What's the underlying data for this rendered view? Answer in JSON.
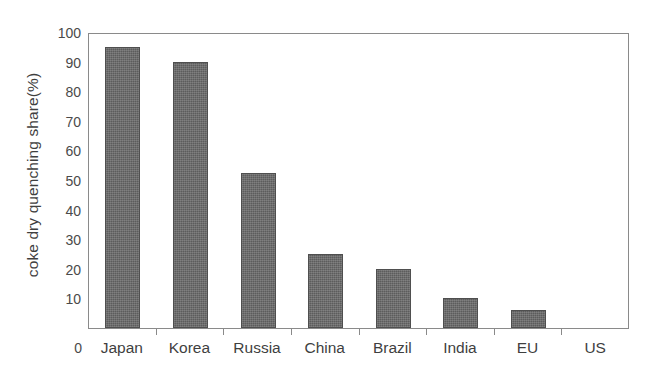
{
  "chart_data": {
    "type": "bar",
    "title": "",
    "subtitle": "",
    "xlabel": "",
    "ylabel": "coke dry quenching share(%)",
    "categories": [
      "Japan",
      "Korea",
      "Russia",
      "China",
      "Brazil",
      "India",
      "EU",
      "US"
    ],
    "values": [
      95,
      90,
      52.5,
      25,
      20,
      10,
      6,
      0
    ],
    "series": [
      {
        "name": "coke dry quenching share",
        "values": [
          95,
          90,
          52.5,
          25,
          20,
          10,
          6,
          0
        ]
      }
    ],
    "ylim": [
      0,
      100
    ],
    "yticks": [
      0,
      10,
      20,
      30,
      40,
      50,
      60,
      70,
      80,
      90,
      100
    ],
    "ytick_labels": [
      "0",
      "10",
      "20",
      "30",
      "40",
      "50",
      "60",
      "70",
      "80",
      "90",
      "100"
    ],
    "origin_label": "0",
    "grid": false,
    "legend": false,
    "legend_position": "none",
    "bar_color": "#5c5c5c",
    "frame_color": "#8a8a8a",
    "text_color": "#3f3f3f",
    "annotations": []
  }
}
